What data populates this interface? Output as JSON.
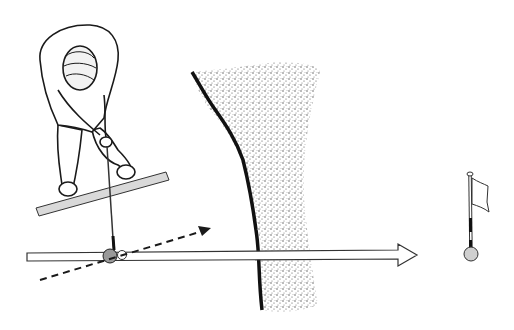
{
  "illustration": {
    "subject": "Golfer addressing ball aligned to target flag across bunker",
    "elements": {
      "golfer": "golfer-top-down",
      "alignment_club": "alignment-stick",
      "target_line": "target-line-arrow",
      "swing_path": "dashed-swing-path-arrow",
      "ball": "golf-ball",
      "bunker": "sand-bunker",
      "flag": "pin-flag",
      "hole": "cup"
    },
    "colors": {
      "ink": "#1a1a1a",
      "stick_fill": "#d9d9d9",
      "sand": "#bdbdbd",
      "cup_fill": "#cfcfcf",
      "background": "#ffffff"
    }
  }
}
